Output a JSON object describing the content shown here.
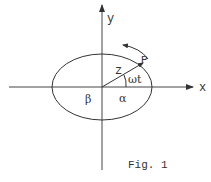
{
  "figure": {
    "caption": "Fig. 1",
    "axes": {
      "x_label": "x",
      "y_label": "y"
    },
    "labels": {
      "point": "P",
      "vector": "z",
      "angle": "ωt",
      "semi_axis_right": "α",
      "semi_axis_left": "β"
    },
    "ellipse": {
      "cx": 102,
      "cy": 87,
      "rx": 50,
      "ry": 33
    },
    "rotation_direction": "counterclockwise",
    "colors": {
      "stroke": "#333333",
      "background": "#ffffff"
    }
  }
}
